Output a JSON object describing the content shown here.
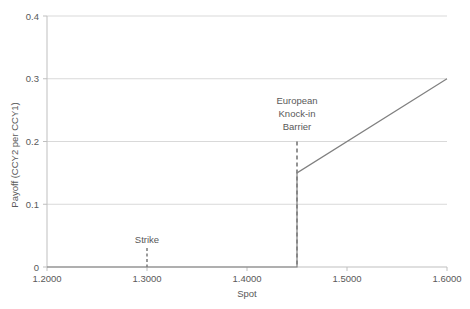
{
  "chart_data": {
    "type": "line",
    "title": "",
    "xlabel": "Spot",
    "ylabel": "Payoff (CCY2 per CCY1)",
    "xlim": [
      1.2,
      1.6
    ],
    "ylim": [
      0,
      0.4
    ],
    "grid": true,
    "legend": "none",
    "x_ticks": [
      "1.2000",
      "1.3000",
      "1.4000",
      "1.5000",
      "1.6000"
    ],
    "x_tick_values": [
      1.2,
      1.3,
      1.4,
      1.5,
      1.6
    ],
    "y_ticks": [
      "0",
      "0.1",
      "0.2",
      "0.3",
      "0.4"
    ],
    "y_tick_values": [
      0,
      0.1,
      0.2,
      0.3,
      0.4
    ],
    "series": [
      {
        "name": "Payoff",
        "color": "#808080",
        "points": [
          {
            "x": 1.2,
            "y": 0
          },
          {
            "x": 1.45,
            "y": 0
          },
          {
            "x": 1.45,
            "y": 0.15
          },
          {
            "x": 1.6,
            "y": 0.3
          }
        ]
      }
    ],
    "annotations": [
      {
        "name": "strike",
        "lines": [
          "Strike"
        ],
        "x": 1.3,
        "marker": "dashed-tick",
        "color": "#595959"
      },
      {
        "name": "barrier",
        "lines": [
          "European",
          "Knock-in",
          "Barrier"
        ],
        "x": 1.45,
        "marker": "dashed-vertical",
        "color": "#595959"
      }
    ],
    "colors": {
      "gridline": "#d9d9d9",
      "axis": "#bfbfbf",
      "line": "#808080",
      "annotation": "#595959",
      "text": "#595959",
      "background": "#ffffff"
    }
  }
}
